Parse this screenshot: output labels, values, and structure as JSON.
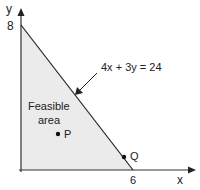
{
  "diagram": {
    "axes": {
      "x_label": "x",
      "y_label": "y"
    },
    "intercepts": {
      "y_intercept": "8",
      "x_intercept": "6"
    },
    "constraint": {
      "equation": "4x + 3y = 24"
    },
    "region": {
      "label_line1": "Feasible",
      "label_line2": "area",
      "fill_color": "#ebebeb"
    },
    "points": [
      {
        "name": "P"
      },
      {
        "name": "Q"
      }
    ],
    "colors": {
      "line": "#222222",
      "axis": "#333333",
      "text": "#222222"
    }
  }
}
